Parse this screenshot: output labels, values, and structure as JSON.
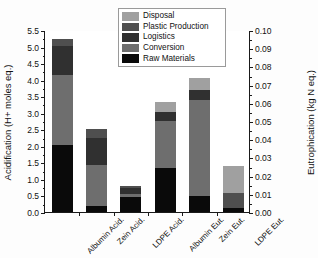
{
  "chart_data": {
    "type": "bar",
    "subtype": "stacked-bar",
    "title": "",
    "xlabel": "",
    "ylabel": "Acidification (H+ moles eq.)",
    "y2label": "Eutrophication (kg N eq.)",
    "ylim": [
      0.0,
      5.5
    ],
    "y2lim": [
      0.0,
      0.1
    ],
    "ytick_step": 0.5,
    "y2tick_step": 0.01,
    "grid": false,
    "legend_position": "top-center",
    "categories": [
      "Albumin Acid.",
      "Zein Acid.",
      "LDPE Acid.",
      "Albumin Eut.",
      "Zein Eut.",
      "LDPE Eut."
    ],
    "category_axis_map": [
      "left",
      "left",
      "left",
      "right",
      "right",
      "right"
    ],
    "yticks": [
      "0.0",
      "0.5",
      "1.0",
      "1.5",
      "2.0",
      "2.5",
      "3.0",
      "3.5",
      "4.0",
      "4.5",
      "5.0",
      "5.5"
    ],
    "y2ticks": [
      "0.00",
      "0.01",
      "0.02",
      "0.03",
      "0.04",
      "0.05",
      "0.06",
      "0.07",
      "0.08",
      "0.09",
      "0.10"
    ],
    "series": [
      {
        "name": "Raw Materials",
        "color": "#0a0a0a",
        "values": [
          2.03,
          0.19,
          0.44,
          1.33,
          0.48,
          0.13
        ]
      },
      {
        "name": "Conversion",
        "color": "#6e6e6e",
        "values": [
          2.12,
          1.22,
          0.1,
          1.42,
          2.92,
          0.0
        ]
      },
      {
        "name": "Logistics",
        "color": "#303030",
        "values": [
          0.88,
          0.83,
          0.18,
          0.28,
          0.3,
          0.0
        ]
      },
      {
        "name": "Plastic Production",
        "color": "#4f4f4f",
        "values": [
          0.2,
          0.28,
          0.07,
          0.0,
          0.0,
          0.45
        ]
      },
      {
        "name": "Disposal",
        "color": "#a0a0a0",
        "values": [
          0.0,
          0.0,
          0.0,
          0.3,
          0.35,
          0.82
        ]
      }
    ],
    "stack_order_bottom_to_top": [
      "Raw Materials",
      "Conversion",
      "Logistics",
      "Plastic Production",
      "Disposal"
    ],
    "totals": [
      5.22,
      2.51,
      0.79,
      3.32,
      4.05,
      1.4
    ]
  },
  "legend": {
    "entries": [
      {
        "label": "Disposal",
        "color": "#a0a0a0"
      },
      {
        "label": "Plastic Production",
        "color": "#4f4f4f"
      },
      {
        "label": "Logistics",
        "color": "#303030"
      },
      {
        "label": "Conversion",
        "color": "#6e6e6e"
      },
      {
        "label": "Raw Materials",
        "color": "#0a0a0a"
      }
    ]
  },
  "axes": {
    "left_title": "Acidification (H+ moles eq.)",
    "right_title": "Eutrophication (kg N eq.)"
  },
  "colors": {
    "axis": "#1a1a1a",
    "text": "#111111",
    "background": "#ffffff"
  }
}
